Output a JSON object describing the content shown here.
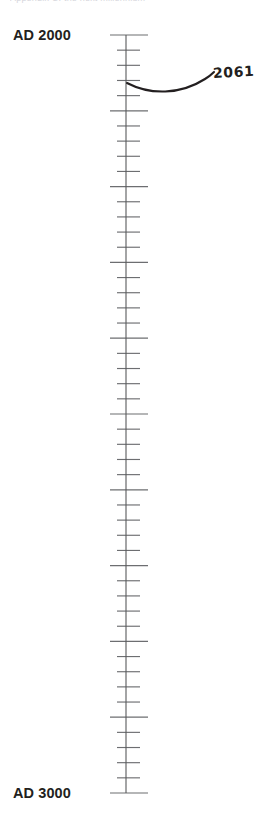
{
  "figure": {
    "type": "timeline-axis",
    "clipped_top_caption": "Appendix C: the next millennium",
    "orientation": "vertical"
  },
  "axis": {
    "start_label": "AD 2000",
    "end_label": "AD 3000",
    "start_year": 2000,
    "end_year": 3000,
    "start_y_px": 35,
    "end_y_px": 793,
    "axis_x_px": 126,
    "minor_tick_years": 20,
    "major_tick_years": 100,
    "minor_tick_left_px": 117,
    "minor_tick_right_px": 140,
    "major_tick_left_px": 110,
    "major_tick_right_px": 148,
    "line_color": "#58595b",
    "tick_color": "#6d6e71"
  },
  "annotation": {
    "label": "2061",
    "year": 2061,
    "leader_color": "#231f20",
    "anchor_y_px": 83
  },
  "chart_data": {
    "type": "line",
    "title": "",
    "xlabel": "",
    "ylabel": "Year (AD)",
    "ylim": [
      2000,
      3000
    ],
    "grid": false,
    "legend": null,
    "categories": [
      "AD 2000",
      "AD 3000"
    ],
    "values": [
      2000,
      3000
    ],
    "annotations": [
      {
        "label": "2061",
        "value": 2061
      }
    ],
    "tick_labels": [
      "AD 2000",
      "AD 3000"
    ],
    "minor_tick_interval": 20,
    "major_tick_interval": 100
  }
}
